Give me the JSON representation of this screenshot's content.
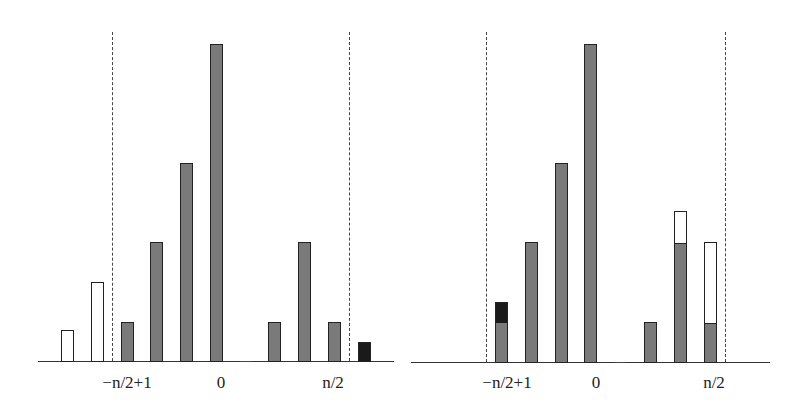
{
  "colors": {
    "gray": "#7a7a7a",
    "white": "#ffffff",
    "black": "#1a1a1a",
    "line": "#333333"
  },
  "left_panel": {
    "labels": {
      "left": "−n/2+1",
      "center": "0",
      "right": "n/2"
    },
    "bars": [
      {
        "index": 0,
        "segments": [
          {
            "fill": "white",
            "height": 31
          }
        ]
      },
      {
        "index": 1,
        "segments": [
          {
            "fill": "white",
            "height": 79
          }
        ]
      },
      {
        "index": 2,
        "segments": [
          {
            "fill": "gray",
            "height": 39
          }
        ]
      },
      {
        "index": 3,
        "segments": [
          {
            "fill": "gray",
            "height": 119
          }
        ]
      },
      {
        "index": 4,
        "segments": [
          {
            "fill": "gray",
            "height": 198
          }
        ]
      },
      {
        "index": 5,
        "segments": [
          {
            "fill": "gray",
            "height": 317
          }
        ]
      },
      {
        "index": 6,
        "segments": []
      },
      {
        "index": 7,
        "segments": [
          {
            "fill": "gray",
            "height": 39
          }
        ]
      },
      {
        "index": 8,
        "segments": [
          {
            "fill": "gray",
            "height": 119
          }
        ]
      },
      {
        "index": 9,
        "segments": [
          {
            "fill": "gray",
            "height": 39
          }
        ]
      },
      {
        "index": 10,
        "segments": [
          {
            "fill": "black",
            "height": 19
          }
        ]
      }
    ]
  },
  "right_panel": {
    "labels": {
      "left": "−n/2+1",
      "center": "0",
      "right": "n/2"
    },
    "bars": [
      {
        "index": 0,
        "segments": [
          {
            "fill": "gray",
            "height": 40
          },
          {
            "fill": "black",
            "height": 20
          }
        ]
      },
      {
        "index": 1,
        "segments": [
          {
            "fill": "gray",
            "height": 120
          }
        ]
      },
      {
        "index": 2,
        "segments": [
          {
            "fill": "gray",
            "height": 199
          }
        ]
      },
      {
        "index": 3,
        "segments": [
          {
            "fill": "gray",
            "height": 318
          }
        ]
      },
      {
        "index": 4,
        "segments": []
      },
      {
        "index": 5,
        "segments": [
          {
            "fill": "gray",
            "height": 40
          }
        ]
      },
      {
        "index": 6,
        "segments": [
          {
            "fill": "gray",
            "height": 120
          },
          {
            "fill": "white",
            "height": 31
          }
        ]
      },
      {
        "index": 7,
        "segments": [
          {
            "fill": "gray",
            "height": 40
          },
          {
            "fill": "white",
            "height": 80
          }
        ]
      }
    ]
  }
}
